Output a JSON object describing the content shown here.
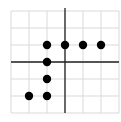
{
  "chart_data": {
    "type": "scatter",
    "title": "",
    "xlabel": "",
    "ylabel": "",
    "xlim": [
      -3,
      3
    ],
    "ylim": [
      -3,
      3
    ],
    "grid": true,
    "x": [
      -1,
      0,
      1,
      2,
      -1,
      -1,
      -2,
      -1
    ],
    "y": [
      1,
      1,
      1,
      1,
      0,
      -1,
      -2,
      -2
    ],
    "points": [
      {
        "x": -1,
        "y": 1
      },
      {
        "x": 0,
        "y": 1
      },
      {
        "x": 1,
        "y": 1
      },
      {
        "x": 2,
        "y": 1
      },
      {
        "x": -1,
        "y": 0
      },
      {
        "x": -1,
        "y": -1
      },
      {
        "x": -2,
        "y": -2
      },
      {
        "x": -1,
        "y": -2
      }
    ],
    "colors": {
      "grid": "#d9d9d9",
      "axis": "#222222",
      "point": "#000000",
      "background": "#ffffff"
    }
  }
}
